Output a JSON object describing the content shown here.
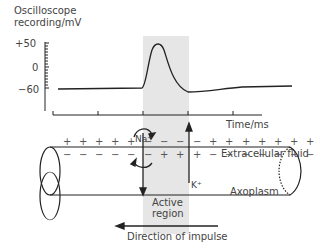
{
  "graph": {
    "ylabel_line1": "Oscilloscope",
    "ylabel_line2": "recording/mV",
    "yticks": [
      "+50",
      "0",
      "−60"
    ],
    "xlabel": "Time/ms"
  },
  "axon": {
    "na_label": "Na⁺",
    "k_label": "K⁺",
    "extracellular_label": "Extracellular fluid",
    "axoplasm_label": "Axoplasm",
    "active_region_line1": "Active",
    "active_region_line2": "region",
    "direction_label": "Direction of impulse",
    "outside_charges": [
      "+",
      "+",
      "+",
      "+",
      "+",
      "−",
      "−",
      "−",
      "−",
      "+",
      "+",
      "+",
      "+",
      "+",
      "+",
      "+"
    ],
    "inside_charges": [
      "−",
      "−",
      "−",
      "−",
      "−",
      "−",
      "+",
      "+",
      "+",
      "−",
      "−",
      "−",
      "−",
      "−",
      "−",
      "−"
    ]
  },
  "colors": {
    "shade": "#e6e6e6",
    "line": "#222222"
  },
  "chart_data": {
    "type": "line",
    "xlabel": "Time/ms",
    "ylabel": "Oscilloscope recording/mV",
    "yticks": [
      50,
      0,
      -60
    ],
    "ylim": [
      -90,
      55
    ],
    "x": [
      0,
      1,
      2,
      2.2,
      2.5,
      2.8,
      3.2,
      3.6,
      4,
      5,
      6
    ],
    "values": [
      -60,
      -60,
      -60,
      -55,
      40,
      50,
      10,
      -45,
      -70,
      -63,
      -60
    ]
  }
}
